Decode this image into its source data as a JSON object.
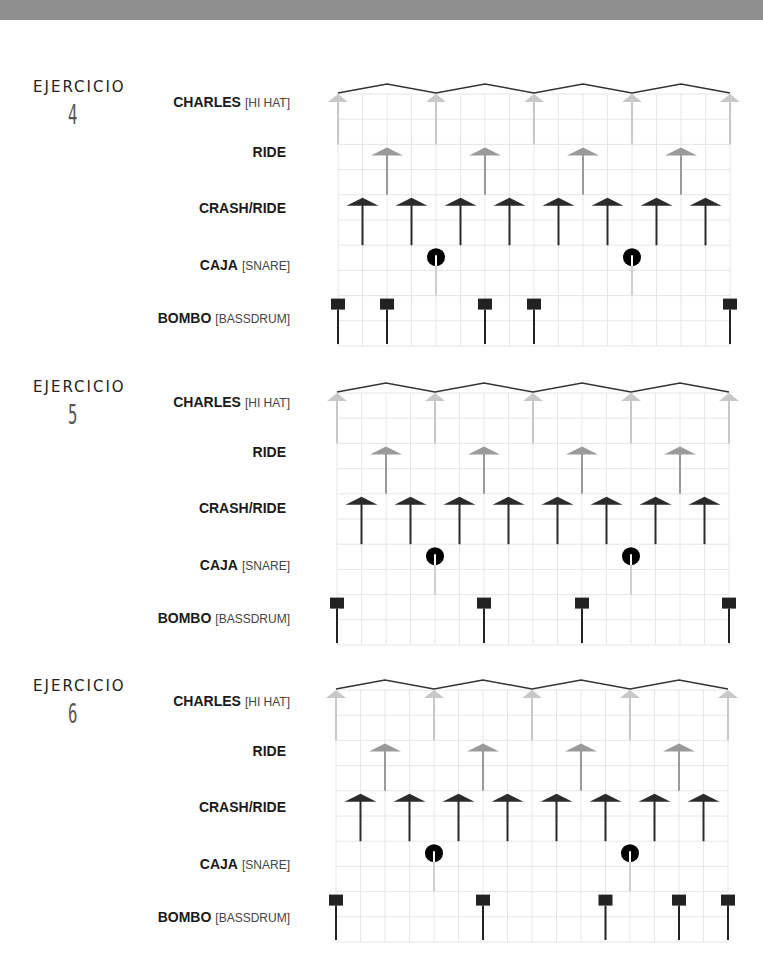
{
  "page": {
    "top_band_color": "#8f8f8f"
  },
  "colors": {
    "grid": "#e6e6e6",
    "hihat": "#c8c8c8",
    "ride": "#9a9a9a",
    "crash": "#2b2b2b",
    "snare": "#000000",
    "snare_stem": "#cfcfcf",
    "bass": "#222222",
    "zigzag": "#333333"
  },
  "grid": {
    "columns": 16,
    "rows": 10,
    "col_width": 24.5,
    "row_height": 25.2
  },
  "exercises": [
    {
      "title": "EJERCICIO",
      "number": "4",
      "instruments": [
        {
          "name": "CHARLES",
          "sub": "[HI HAT]",
          "hits": [
            0,
            4,
            8,
            12,
            16
          ]
        },
        {
          "name": "RIDE",
          "sub": "",
          "hits": [
            2,
            6,
            10,
            14
          ]
        },
        {
          "name": "CRASH/RIDE",
          "sub": "",
          "hits": [
            1,
            3,
            5,
            7,
            9,
            11,
            13,
            15
          ]
        },
        {
          "name": "CAJA",
          "sub": "[SNARE]",
          "hits": [
            4,
            12
          ]
        },
        {
          "name": "BOMBO",
          "sub": "[BASSDRUM]",
          "hits": [
            0,
            2,
            6,
            8,
            16
          ]
        }
      ]
    },
    {
      "title": "EJERCICIO",
      "number": "5",
      "instruments": [
        {
          "name": "CHARLES",
          "sub": "[HI HAT]",
          "hits": [
            0,
            4,
            8,
            12,
            16
          ]
        },
        {
          "name": "RIDE",
          "sub": "",
          "hits": [
            2,
            6,
            10,
            14
          ]
        },
        {
          "name": "CRASH/RIDE",
          "sub": "",
          "hits": [
            1,
            3,
            5,
            7,
            9,
            11,
            13,
            15
          ]
        },
        {
          "name": "CAJA",
          "sub": "[SNARE]",
          "hits": [
            4,
            12
          ]
        },
        {
          "name": "BOMBO",
          "sub": "[BASSDRUM]",
          "hits": [
            0,
            6,
            10,
            16
          ]
        }
      ]
    },
    {
      "title": "EJERCICIO",
      "number": "6",
      "instruments": [
        {
          "name": "CHARLES",
          "sub": "[HI HAT]",
          "hits": [
            0,
            4,
            8,
            12,
            16
          ]
        },
        {
          "name": "RIDE",
          "sub": "",
          "hits": [
            2,
            6,
            10,
            14
          ]
        },
        {
          "name": "CRASH/RIDE",
          "sub": "",
          "hits": [
            1,
            3,
            5,
            7,
            9,
            11,
            13,
            15
          ]
        },
        {
          "name": "CAJA",
          "sub": "[SNARE]",
          "hits": [
            4,
            12
          ]
        },
        {
          "name": "BOMBO",
          "sub": "[BASSDRUM]",
          "hits": [
            0,
            6,
            11,
            14,
            16
          ]
        }
      ]
    }
  ]
}
